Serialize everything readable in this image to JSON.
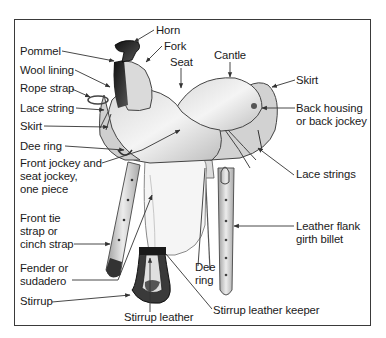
{
  "diagram": {
    "labels": {
      "horn": "Horn",
      "fork": "Fork",
      "seat": "Seat",
      "cantle": "Cantle",
      "pommel": "Pommel",
      "wool_lining": "Wool lining",
      "rope_strap": "Rope strap",
      "lace_string": "Lace string",
      "skirt_front": "Skirt",
      "dee_ring_front": "Dee ring",
      "front_jockey": [
        "Front jockey and",
        "seat jockey,",
        "one piece"
      ],
      "front_tie": [
        "Front tie",
        "strap or",
        "cinch strap"
      ],
      "fender": [
        "Fender or",
        "sudadero"
      ],
      "stirrup": "Stirrup",
      "stirrup_leather": "Stirrup leather",
      "stirrup_leather_keeper": "Stirrup leather keeper",
      "dee_ring_rear": [
        "Dee",
        "ring"
      ],
      "leather_flank": [
        "Leather flank",
        "girth billet"
      ],
      "lace_strings": "Lace strings",
      "back_housing": [
        "Back housing",
        "or back jockey"
      ],
      "skirt_rear": "Skirt"
    },
    "colors": {
      "frame": "#3a3a3a",
      "text": "#1a1a1a",
      "leader": "#333333",
      "leather_light": "#e6e6e6",
      "leather_mid": "#b5b5b5",
      "leather_dark": "#2a2a2a"
    }
  }
}
